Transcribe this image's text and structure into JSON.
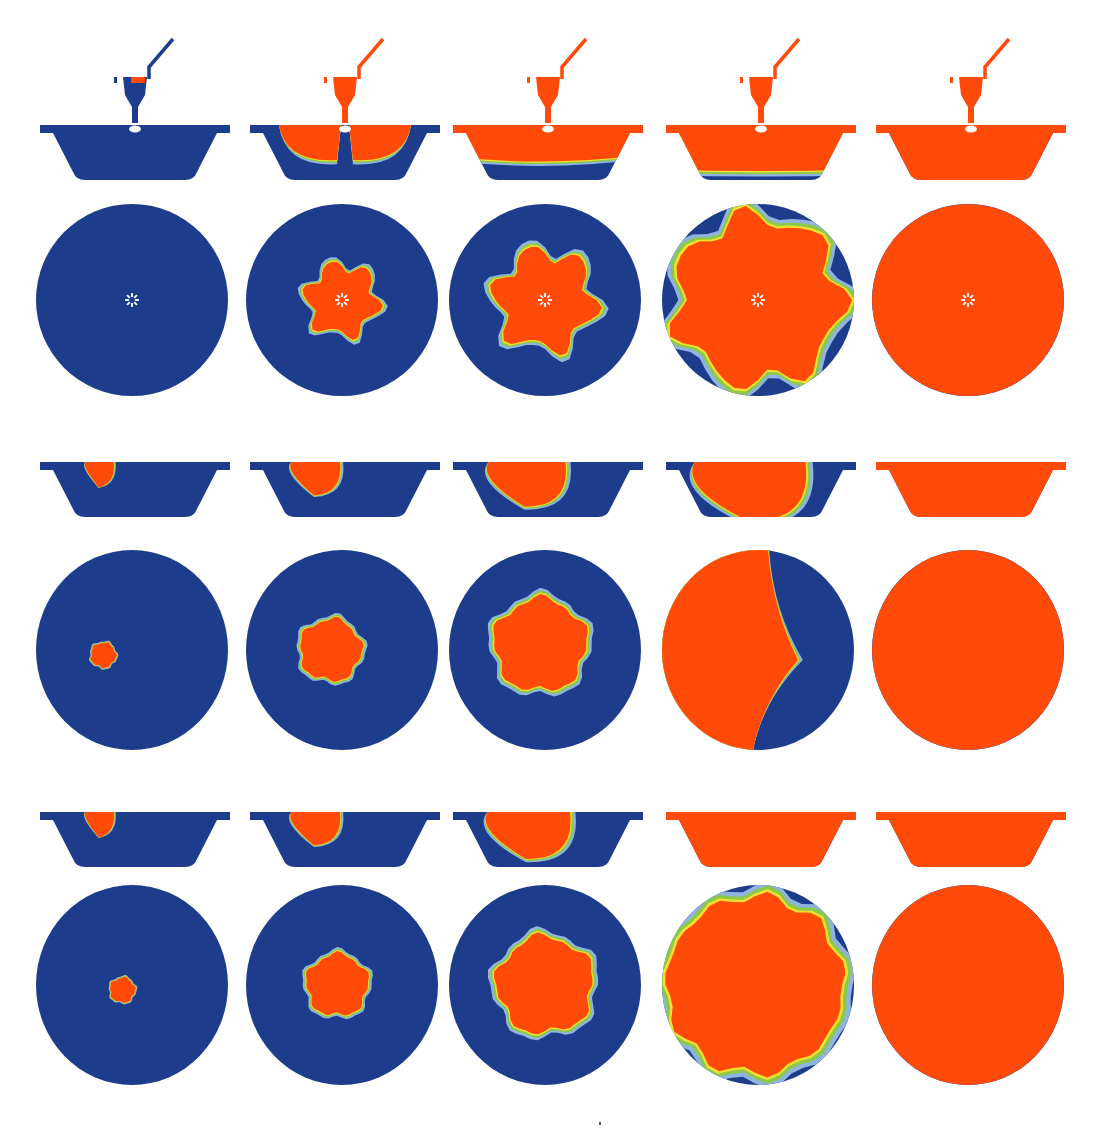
{
  "figure": {
    "title": "Mold filling simulation sequence",
    "columns": 5,
    "colors": {
      "empty": "#1e3c8c",
      "filled": "#ff4a0a",
      "band_outer": "#8fb4e0",
      "band_mid": "#8cc84a",
      "band_inner": "#f0e030",
      "gate": "#ffffff"
    },
    "sections": [
      {
        "name": "case-a",
        "has_sprue": true,
        "side_views": [
          {
            "fill": "sprue-only"
          },
          {
            "fill": "two-lobes"
          },
          {
            "fill": "top-band"
          },
          {
            "fill": "mostly"
          },
          {
            "fill": "full"
          }
        ],
        "top_views": [
          {
            "fill_radius": 0,
            "shape": "star",
            "gate_marker": true
          },
          {
            "fill_radius": 0.36,
            "shape": "star",
            "gate_marker": true
          },
          {
            "fill_radius": 0.5,
            "shape": "star",
            "gate_marker": true
          },
          {
            "fill_radius": 0.86,
            "shape": "lobed",
            "gate_marker": true
          },
          {
            "fill_radius": 1.0,
            "shape": "full",
            "gate_marker": true
          }
        ]
      },
      {
        "name": "case-b",
        "has_sprue": false,
        "side_views": [
          {
            "fill": 0.12
          },
          {
            "fill": 0.3
          },
          {
            "fill": 0.55
          },
          {
            "fill": 0.85
          },
          {
            "fill": 1.0
          }
        ],
        "top_views": [
          {
            "fill_radius": 0.13,
            "cx": -0.3,
            "cy": 0.05,
            "shape": "blob"
          },
          {
            "fill_radius": 0.32,
            "cx": -0.12,
            "cy": 0.0,
            "shape": "blob"
          },
          {
            "fill_radius": 0.48,
            "cx": -0.05,
            "cy": -0.05,
            "shape": "blob"
          },
          {
            "fill_radius": 0.9,
            "shape": "crescent"
          },
          {
            "fill_radius": 1.0,
            "shape": "full-edge"
          }
        ]
      },
      {
        "name": "case-c",
        "has_sprue": false,
        "side_views": [
          {
            "fill": 0.12
          },
          {
            "fill": 0.3
          },
          {
            "fill": 0.6
          },
          {
            "fill": 1.0
          },
          {
            "fill": 1.0
          }
        ],
        "top_views": [
          {
            "fill_radius": 0.13,
            "cx": -0.1,
            "cy": 0.05,
            "shape": "blob"
          },
          {
            "fill_radius": 0.32,
            "cx": -0.05,
            "cy": 0.0,
            "shape": "blob"
          },
          {
            "fill_radius": 0.5,
            "cx": 0.0,
            "cy": 0.0,
            "shape": "blob"
          },
          {
            "fill_radius": 0.92,
            "shape": "near-full"
          },
          {
            "fill_radius": 1.0,
            "shape": "full"
          }
        ]
      }
    ]
  }
}
